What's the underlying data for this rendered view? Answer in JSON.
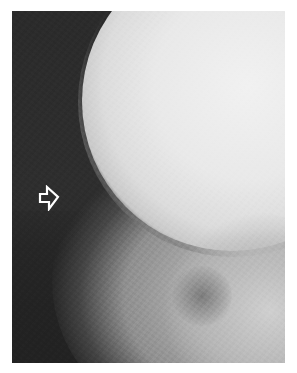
{
  "image": {
    "type": "radiograph",
    "description": "Lateral skull radiograph (grayscale) with an open white arrow annotation pointing right",
    "frame": {
      "x": 12,
      "y": 11,
      "width": 273,
      "height": 352
    },
    "background_color": "#ffffff",
    "colors": {
      "dark_region": "#2b2b2b",
      "bone_bright": "#ececec",
      "mid_gray": "#a8a8a8"
    }
  },
  "annotations": [
    {
      "kind": "arrow",
      "icon": "open-arrow-right-icon",
      "direction": "right",
      "color": "#ffffff",
      "position": {
        "x": 26,
        "y": 174
      }
    }
  ]
}
